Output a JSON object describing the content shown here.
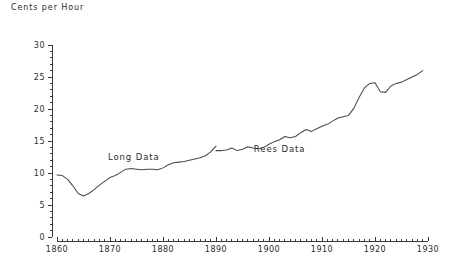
{
  "chart_data": {
    "type": "line",
    "title": "",
    "ylabel": "Cents per Hour",
    "xlabel": "",
    "xlim": [
      1860,
      1930
    ],
    "ylim": [
      0,
      30
    ],
    "xticks": [
      1860,
      1870,
      1880,
      1890,
      1900,
      1910,
      1920,
      1930
    ],
    "xtick_labels": [
      "1860",
      "1870",
      "1880",
      "1890",
      "1900",
      "1910",
      "1920",
      "1930"
    ],
    "yticks": [
      0,
      5,
      10,
      15,
      20,
      25,
      30
    ],
    "ytick_labels": [
      "0",
      "5",
      "10",
      "15",
      "20",
      "25",
      "30"
    ],
    "minor_tick_interval_x": 1,
    "minor_tick_interval_y": 1,
    "grid": false,
    "legend": "none",
    "annotations": [
      {
        "text": "Long Data",
        "x": 1874.5,
        "y": 12.0
      },
      {
        "text": "Rees Data",
        "x": 1902.0,
        "y": 13.3
      }
    ],
    "series": [
      {
        "name": "Long Data",
        "color": "#4a4a4a",
        "x": [
          1860,
          1861,
          1862,
          1863,
          1864,
          1865,
          1866,
          1867,
          1868,
          1869,
          1870,
          1871,
          1872,
          1873,
          1874,
          1875,
          1876,
          1877,
          1878,
          1879,
          1880,
          1881,
          1882,
          1883,
          1884,
          1885,
          1886,
          1887,
          1888,
          1889,
          1890
        ],
        "values": [
          9.7,
          9.6,
          9.0,
          8.0,
          6.8,
          6.4,
          6.8,
          7.4,
          8.1,
          8.7,
          9.3,
          9.6,
          10.1,
          10.6,
          10.7,
          10.6,
          10.5,
          10.6,
          10.6,
          10.5,
          10.8,
          11.3,
          11.6,
          11.7,
          11.8,
          12.0,
          12.2,
          12.4,
          12.7,
          13.3,
          14.2
        ]
      },
      {
        "name": "Rees Data",
        "color": "#4a4a4a",
        "x": [
          1890,
          1891,
          1892,
          1893,
          1894,
          1895,
          1896,
          1897,
          1898,
          1899,
          1900,
          1901,
          1902,
          1903,
          1904,
          1905,
          1906,
          1907,
          1908,
          1909,
          1910,
          1911,
          1912,
          1913,
          1914,
          1915,
          1916,
          1917,
          1918,
          1919,
          1920,
          1921,
          1922,
          1923,
          1924,
          1925,
          1926,
          1927,
          1928,
          1929
        ],
        "values": [
          13.5,
          13.5,
          13.6,
          13.9,
          13.5,
          13.7,
          14.1,
          13.9,
          13.8,
          14.0,
          14.5,
          14.9,
          15.2,
          15.7,
          15.5,
          15.7,
          16.3,
          16.8,
          16.5,
          16.9,
          17.3,
          17.6,
          18.1,
          18.6,
          18.8,
          19.0,
          20.1,
          21.8,
          23.3,
          24.0,
          24.1,
          22.7,
          22.6,
          23.6,
          24.0,
          24.2,
          24.6,
          25.0,
          25.4,
          26.0
        ]
      }
    ]
  }
}
